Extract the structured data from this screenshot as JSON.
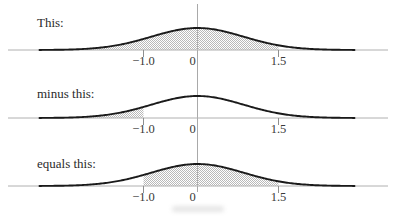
{
  "chart_data": {
    "type": "area",
    "description_visible": false,
    "x_range": [
      -3,
      3
    ],
    "x_tick_values": [
      -1.0,
      0,
      1.5
    ],
    "x_tick_labels": [
      "−1.0",
      "0",
      "1.5"
    ],
    "curve": "bell-shaped density curve centered at 0",
    "panels": [
      {
        "label": "This:",
        "shaded_interval": [
          -3.0,
          1.5
        ]
      },
      {
        "label": "minus this:",
        "shaded_interval": [
          -3.0,
          -1.0
        ]
      },
      {
        "label": "equals this:",
        "shaded_interval": [
          -1.0,
          1.5
        ]
      }
    ]
  },
  "colors": {
    "curve": "#1a1a1a",
    "baseline": "#b0b0b0",
    "zero_line": "#a9a9a9",
    "tick": "#8f8f8f",
    "shade": "#b9b9b9",
    "panel_label": "#2b2b2b",
    "tick_label": "#3a3a3a"
  }
}
